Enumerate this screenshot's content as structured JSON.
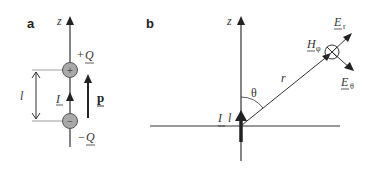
{
  "panel_a": {
    "label": "a",
    "axis_label": "z",
    "charge_positive": {
      "sign": "+",
      "prefix": "+",
      "symbol": "Q"
    },
    "charge_negative": {
      "sign": "−",
      "prefix": "−",
      "symbol": "Q"
    },
    "current_label": "I",
    "length_label": "l",
    "dipole_label": "p"
  },
  "panel_b": {
    "label": "b",
    "axis_label": "z",
    "source_label": {
      "current": "I",
      "length": "l"
    },
    "angle_label": "θ",
    "radius_label": "r",
    "field_H": {
      "symbol": "H",
      "subscript": "φ"
    },
    "field_Er": {
      "symbol": "E",
      "subscript": "r"
    },
    "field_Etheta": {
      "symbol": "E",
      "subscript": "θ"
    }
  },
  "colors": {
    "line": "#333333",
    "charge_fill": "#a9a9a9",
    "charge_stroke": "#555555"
  }
}
